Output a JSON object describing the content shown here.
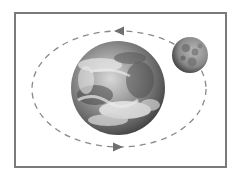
{
  "diagram": {
    "frame": {
      "x": 14,
      "y": 12,
      "width": 211,
      "height": 154,
      "border_color": "#7a7a7a"
    },
    "orbit": {
      "cx": 119,
      "cy": 89,
      "rx": 87,
      "ry": 58,
      "style": "dashed",
      "color": "#8a8a8a",
      "direction": "counter-clockwise"
    },
    "arrows": [
      {
        "position": "top",
        "x": 120,
        "y": 31,
        "direction": "left"
      },
      {
        "position": "bottom",
        "x": 117,
        "y": 147,
        "direction": "right"
      }
    ],
    "earth": {
      "label": "Earth",
      "cx": 118,
      "cy": 88,
      "r": 47
    },
    "moon": {
      "label": "Moon",
      "cx": 190,
      "cy": 55,
      "r": 18
    },
    "colors": {
      "earth_light": "#e6e6e6",
      "earth_dark": "#4a4a4a",
      "moon_light": "#a8a8a8",
      "moon_dark": "#3a3a3a"
    }
  }
}
